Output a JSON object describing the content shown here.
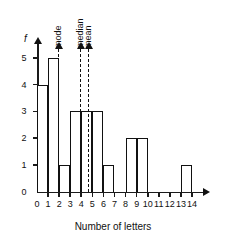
{
  "chart_data": {
    "type": "bar",
    "title": "",
    "subtitle": "",
    "xlabel": "Number of letters",
    "ylabel": "f",
    "xlim": [
      0,
      14
    ],
    "ylim": [
      0,
      5
    ],
    "grid": false,
    "legend_position": "none",
    "bin_width": 1,
    "x_ticks": [
      "0",
      "1",
      "2",
      "3",
      "4",
      "5",
      "6",
      "7",
      "8",
      "9",
      "10",
      "11",
      "12",
      "13",
      "14"
    ],
    "y_ticks": [
      "0",
      "1",
      "2",
      "3",
      "4",
      "5"
    ],
    "categories": [
      "0-1",
      "1-2",
      "2-3",
      "3-4",
      "4-5",
      "5-6",
      "6-7",
      "7-8",
      "8-9",
      "9-10",
      "10-11",
      "11-12",
      "12-13",
      "13-14"
    ],
    "values": [
      4,
      5,
      1,
      3,
      3,
      3,
      1,
      0,
      2,
      2,
      0,
      0,
      0,
      1
    ],
    "annotations": [
      {
        "label": "mode",
        "x": 2
      },
      {
        "label": "median",
        "x": 4
      },
      {
        "label": "mean",
        "x": 4.7
      }
    ],
    "colors": {
      "bar_outline": "#111111",
      "bar_fill": "#ffffff",
      "axis": "#1a1a1a",
      "annotation_line": "#111111",
      "background": "#ffffff"
    }
  }
}
